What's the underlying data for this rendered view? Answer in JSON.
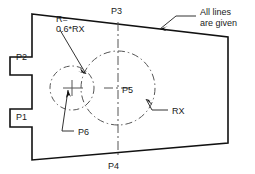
{
  "drawing": {
    "title": "Technical drawing - quadrilateral plate with two construction circles",
    "background_color": "#ffffff",
    "outline_color": "#111111",
    "construction_color": "#555555",
    "text_color": "#1a1a1a",
    "notes": {
      "top_right_line1": "All  lines",
      "top_right_line2": "are  given",
      "radius_note_line1": "R=",
      "radius_note_line2": "0.6*RX",
      "rx_label": "RX"
    },
    "points": [
      {
        "id": "P1",
        "label": "P1",
        "x": 22,
        "y": 116
      },
      {
        "id": "P2",
        "label": "P2",
        "x": 20,
        "y": 56
      },
      {
        "id": "P3",
        "label": "P3",
        "x": 117,
        "y": 16
      },
      {
        "id": "P4",
        "label": "P4",
        "x": 114,
        "y": 165
      },
      {
        "id": "P5",
        "label": "P5",
        "x": 126,
        "y": 91
      },
      {
        "id": "P6",
        "label": "P6",
        "x": 76,
        "y": 132
      }
    ],
    "outline_vertices": "32,14 228,37 228,143 32,160 32,127 10,127 10,109 32,109 32,75 10,75 10,57 32,57",
    "circles": [
      {
        "name": "circle-rx",
        "center_label": "P5",
        "cx": 118,
        "cy": 88,
        "r": 37,
        "style": "dashed"
      },
      {
        "name": "circle-r-small",
        "center_label": "P6",
        "cx": 72,
        "cy": 88,
        "r": 22,
        "style": "dashed"
      }
    ],
    "leaders": {
      "radius_note": "60,30 86,74",
      "rx": "168,110 146,98",
      "p6": "72,128 60,128 68,90",
      "all_lines": "196,20 172,20 152,34"
    }
  }
}
